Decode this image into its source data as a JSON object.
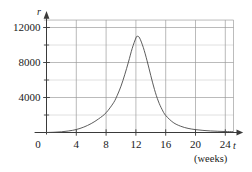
{
  "chart_data": {
    "type": "line",
    "title": "",
    "subtitle": "",
    "xlabel": "t",
    "xunit": "(weeks)",
    "ylabel": "r",
    "xlim": [
      -2,
      26
    ],
    "ylim": [
      0,
      13000
    ],
    "grid": true,
    "legend": null,
    "x_ticks": [
      0,
      4,
      8,
      12,
      16,
      20,
      24
    ],
    "x_tick_labels": [
      "0",
      "4",
      "8",
      "12",
      "16",
      "20",
      "24"
    ],
    "y_ticks": [
      4000,
      8000,
      12000
    ],
    "y_tick_labels": [
      "4000",
      "8000",
      "12000"
    ],
    "y_gridlines": [
      2000,
      4000,
      6000,
      8000,
      10000,
      12000
    ],
    "x_gridlines": [
      4,
      8,
      12,
      16,
      20,
      24
    ],
    "series": [
      {
        "name": "r(t)",
        "x": [
          0,
          1,
          2,
          3,
          4,
          5,
          6,
          7,
          8,
          9,
          9.5,
          10,
          10.5,
          11,
          11.5,
          12,
          12.2,
          12.5,
          13,
          13.5,
          14,
          14.5,
          15,
          15.5,
          16,
          17,
          18,
          19,
          20,
          21,
          22,
          23,
          24,
          25
        ],
        "y": [
          0,
          30,
          80,
          180,
          340,
          620,
          1020,
          1560,
          2260,
          3400,
          4250,
          5300,
          6600,
          8050,
          9600,
          10800,
          11000,
          10800,
          9700,
          8200,
          6500,
          4900,
          3600,
          2650,
          1950,
          1150,
          720,
          470,
          330,
          240,
          180,
          140,
          110,
          90
        ]
      }
    ],
    "peak": {
      "x": 12.2,
      "y": 11000
    },
    "curve_color": "#4a4a4a",
    "grid_color": "#9a9a9a",
    "axis_color": "#3a3a3a",
    "background_color": "#ffffff"
  },
  "axes": {
    "y_axis_name": "r",
    "x_axis_name": "t",
    "x_axis_unit": "(weeks)"
  },
  "ticks": {
    "y": [
      {
        "label": "12000",
        "value": 12000
      },
      {
        "label": "8000",
        "value": 8000
      },
      {
        "label": "4000",
        "value": 4000
      }
    ],
    "x": [
      {
        "label": "0",
        "value": 0
      },
      {
        "label": "4",
        "value": 4
      },
      {
        "label": "8",
        "value": 8
      },
      {
        "label": "12",
        "value": 12
      },
      {
        "label": "16",
        "value": 16
      },
      {
        "label": "20",
        "value": 20
      },
      {
        "label": "24",
        "value": 24
      }
    ]
  }
}
